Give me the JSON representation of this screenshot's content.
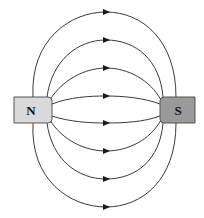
{
  "diagram": {
    "magnets": [
      {
        "id": "north",
        "label": "N",
        "fill": "#d9d9d9"
      },
      {
        "id": "south",
        "label": "S",
        "fill": "#9a9a9a"
      }
    ],
    "field_line_count": 8,
    "arrow_direction": "right (N to S)",
    "line_color": "#3a3a3a"
  }
}
